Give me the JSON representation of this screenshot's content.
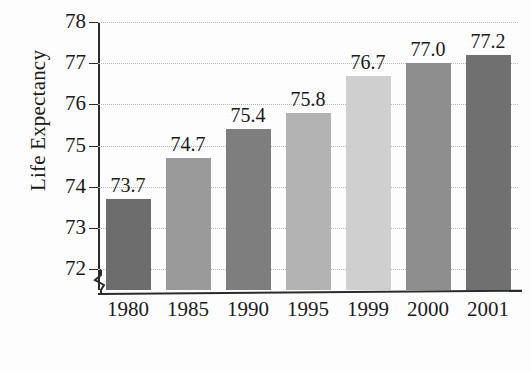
{
  "chart_data": {
    "type": "bar",
    "title": "",
    "xlabel": "Birth Year",
    "ylabel": "Life Expectancy",
    "categories": [
      "1980",
      "1985",
      "1990",
      "1995",
      "1999",
      "2000",
      "2001"
    ],
    "values": [
      73.7,
      74.7,
      75.4,
      75.8,
      76.7,
      77.0,
      77.2
    ],
    "value_labels": [
      "73.7",
      "74.7",
      "75.4",
      "75.8",
      "76.7",
      "77.0",
      "77.2"
    ],
    "ylim": [
      71.5,
      78
    ],
    "yticks": [
      72,
      73,
      74,
      75,
      76,
      77,
      78
    ],
    "ytick_labels": [
      "72",
      "73",
      "74",
      "75",
      "76",
      "77",
      "78"
    ],
    "grid": true,
    "grid_axis": "y",
    "grid_style": "dotted",
    "axis_break": true,
    "axis_break_position": "below 72",
    "legend": "none",
    "bar_colors": [
      "#6d6d6d",
      "#9a9a9a",
      "#7e7e7e",
      "#b3b3b3",
      "#cfcfcf",
      "#8e8e8e",
      "#707070"
    ],
    "background_color": "#fdfdfd",
    "axis_color": "#2b2b2b",
    "gridline_color": "#b9b9b9",
    "text_color": "#1b1b1b"
  }
}
